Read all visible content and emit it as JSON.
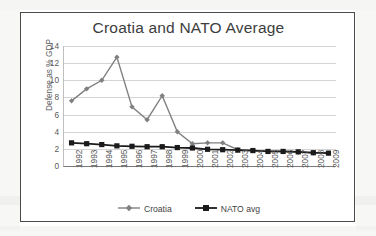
{
  "chart_data": {
    "type": "line",
    "title": "Croatia and NATO Average",
    "xlabel": "",
    "ylabel": "Defense as % GDP",
    "ylim": [
      0,
      14
    ],
    "yticks": [
      0,
      2,
      4,
      6,
      8,
      10,
      12,
      14
    ],
    "grid": true,
    "legend_position": "bottom",
    "categories": [
      "1992",
      "1993",
      "1994",
      "1995",
      "1996",
      "1997",
      "1998",
      "1999",
      "2000",
      "2001",
      "2002",
      "2003",
      "2004",
      "2005",
      "2006",
      "2007",
      "2008",
      "2009"
    ],
    "series": [
      {
        "name": "Croatia",
        "color": "#808080",
        "marker": "diamond",
        "values": [
          7.6,
          9.0,
          10.0,
          12.7,
          6.9,
          5.4,
          8.2,
          4.0,
          2.6,
          2.7,
          2.7,
          1.9,
          1.8,
          1.7,
          1.7,
          1.6,
          1.5,
          1.5
        ]
      },
      {
        "name": "NATO avg",
        "color": "#1a1a1a",
        "marker": "square",
        "values": [
          2.7,
          2.6,
          2.5,
          2.35,
          2.3,
          2.25,
          2.25,
          2.15,
          2.1,
          1.95,
          1.9,
          1.85,
          1.8,
          1.7,
          1.7,
          1.65,
          1.55,
          1.5
        ]
      }
    ]
  },
  "legend": {
    "items": [
      {
        "label": "Croatia"
      },
      {
        "label": "NATO avg"
      }
    ]
  },
  "colors": {
    "croatia": "#808080",
    "nato": "#1a1a1a",
    "grid": "#d4d4d4",
    "frame": "#4a4a4a",
    "text": "#3d3d3d"
  }
}
